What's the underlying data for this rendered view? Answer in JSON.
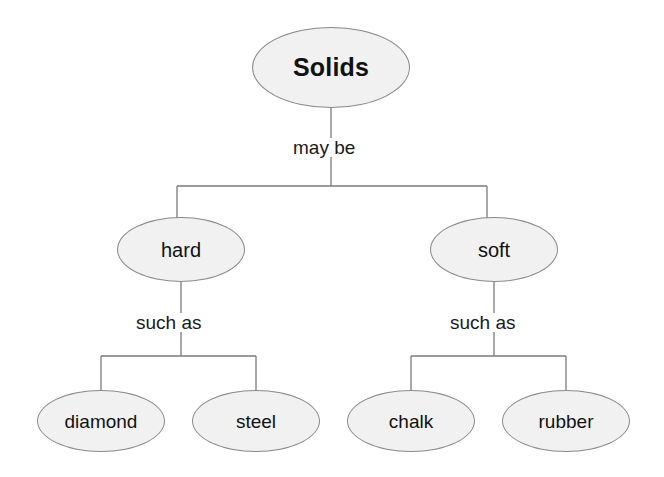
{
  "diagram": {
    "type": "concept-map",
    "title": "Solids",
    "background_color": "#ffffff",
    "node_fill_color": "#f1f1f1",
    "node_border_color": "#8a8a8a",
    "edge_color": "#7a7a7a",
    "text_color": "#111111",
    "root": {
      "label": "Solids",
      "cx": 331,
      "cy": 67,
      "w": 158,
      "h": 81
    },
    "branch_labels": {
      "may_be": "may be",
      "such_as_left": "such as",
      "such_as_right": "such as"
    },
    "level2": [
      {
        "label": "hard",
        "cx": 181,
        "cy": 249,
        "w": 128,
        "h": 65
      },
      {
        "label": "soft",
        "cx": 494,
        "cy": 249,
        "w": 128,
        "h": 65
      }
    ],
    "level3": [
      {
        "label": "diamond",
        "cx": 101,
        "cy": 421,
        "w": 128,
        "h": 62,
        "parent": "hard"
      },
      {
        "label": "steel",
        "cx": 256,
        "cy": 421,
        "w": 128,
        "h": 62,
        "parent": "hard"
      },
      {
        "label": "chalk",
        "cx": 411,
        "cy": 421,
        "w": 128,
        "h": 62,
        "parent": "soft"
      },
      {
        "label": "rubber",
        "cx": 566,
        "cy": 421,
        "w": 128,
        "h": 62,
        "parent": "soft"
      }
    ],
    "relations": [
      {
        "from": "Solids",
        "label": "may be",
        "to": [
          "hard",
          "soft"
        ]
      },
      {
        "from": "hard",
        "label": "such as",
        "to": [
          "diamond",
          "steel"
        ]
      },
      {
        "from": "soft",
        "label": "such as",
        "to": [
          "chalk",
          "rubber"
        ]
      }
    ]
  }
}
